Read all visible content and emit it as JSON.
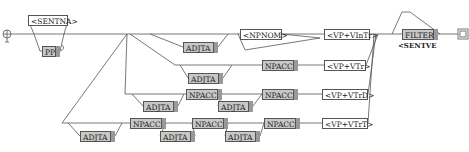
{
  "graph": {
    "initial_state_icon": "initial-state-icon",
    "final_state_icon": "final-state-icon",
    "nodes": [
      {
        "id": "sentna",
        "label": "<SENTNA>",
        "style": "white",
        "x": 28,
        "y": 15,
        "w": 40
      },
      {
        "id": "pp",
        "label": "PP",
        "style": "grey",
        "x": 42,
        "y": 46,
        "w": 18
      },
      {
        "id": "adjta1",
        "label": "ADJTA",
        "style": "grey",
        "x": 183,
        "y": 42,
        "w": 35
      },
      {
        "id": "npnom",
        "label": "<NPNOM>",
        "style": "white",
        "x": 240,
        "y": 34,
        "w": 42
      },
      {
        "id": "vp_vintr",
        "label": "<VP+VInTr>",
        "style": "white",
        "x": 324,
        "y": 34,
        "w": 46
      },
      {
        "id": "adjta2",
        "label": "ADJTA",
        "style": "grey",
        "x": 188,
        "y": 73,
        "w": 35
      },
      {
        "id": "npacc1",
        "label": "NPACC",
        "style": "grey",
        "x": 262,
        "y": 61,
        "w": 36
      },
      {
        "id": "vp_vtr",
        "label": "<VP+VTr>",
        "style": "white",
        "x": 324,
        "y": 61,
        "w": 42
      },
      {
        "id": "adjta3",
        "label": "ADJTA",
        "style": "grey",
        "x": 143,
        "y": 101,
        "w": 35
      },
      {
        "id": "npacc2",
        "label": "NPACC",
        "style": "grey",
        "x": 186,
        "y": 89,
        "w": 36
      },
      {
        "id": "adjta4",
        "label": "ADJTA",
        "style": "grey",
        "x": 218,
        "y": 101,
        "w": 35
      },
      {
        "id": "npacc3",
        "label": "NPACC",
        "style": "grey",
        "x": 262,
        "y": 89,
        "w": 36
      },
      {
        "id": "vp_vtrd",
        "label": "<VP+VTrD>",
        "style": "white",
        "x": 322,
        "y": 89,
        "w": 46
      },
      {
        "id": "adjta5",
        "label": "ADJTA",
        "style": "grey",
        "x": 80,
        "y": 131,
        "w": 35
      },
      {
        "id": "npacc4",
        "label": "NPACC",
        "style": "grey",
        "x": 130,
        "y": 118,
        "w": 36
      },
      {
        "id": "adjta6",
        "label": "ADJTA",
        "style": "grey",
        "x": 160,
        "y": 131,
        "w": 35
      },
      {
        "id": "npacc5",
        "label": "NPACC",
        "style": "grey",
        "x": 192,
        "y": 118,
        "w": 36
      },
      {
        "id": "adjta7",
        "label": "ADJTA",
        "style": "grey",
        "x": 225,
        "y": 131,
        "w": 35
      },
      {
        "id": "npacc6",
        "label": "NPACC",
        "style": "grey",
        "x": 264,
        "y": 118,
        "w": 36
      },
      {
        "id": "vp_vtrt",
        "label": "<VP+VTrT>",
        "style": "white",
        "x": 322,
        "y": 118,
        "w": 46
      },
      {
        "id": "filter",
        "label": "FILTER",
        "style": "grey",
        "x": 402,
        "y": 28,
        "w": 36
      }
    ],
    "output_labels": [
      {
        "id": "sentve",
        "label": "<SENTVE",
        "x": 398,
        "y": 41
      }
    ]
  }
}
